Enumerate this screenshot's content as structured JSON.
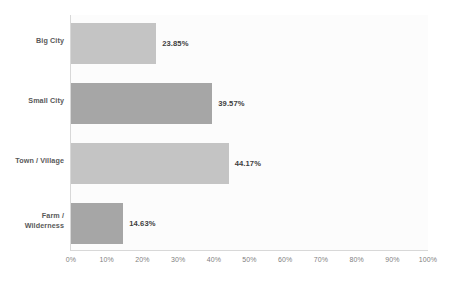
{
  "chart_data": {
    "type": "bar",
    "orientation": "horizontal",
    "title": "",
    "subtitle": "",
    "xlabel": "",
    "ylabel": "",
    "categories": [
      "Big City",
      "Small City",
      "Town / Village",
      "Farm / Wilderness"
    ],
    "values": [
      23.85,
      39.57,
      44.17,
      14.63
    ],
    "value_labels": [
      "23.85%",
      "39.57%",
      "44.17%",
      "14.63%"
    ],
    "xlim": [
      0,
      100
    ],
    "xticks": [
      0,
      10,
      20,
      30,
      40,
      50,
      60,
      70,
      80,
      90,
      100
    ],
    "xtick_labels": [
      "0%",
      "10%",
      "20%",
      "30%",
      "40%",
      "50%",
      "60%",
      "70%",
      "80%",
      "90%",
      "100%"
    ],
    "grid": false,
    "legend": false,
    "bar_colors": [
      "#c4c4c4",
      "#a6a6a6",
      "#c4c4c4",
      "#a6a6a6"
    ],
    "plot_background": "#fcfcfc",
    "page_background": "#ffffff",
    "axis_color": "#d8d8d8",
    "label_color": "#595959",
    "value_label_color": "#404040",
    "tick_label_color": "#7f7f7f"
  },
  "categories": {
    "c0_line1": "Big City",
    "c0_line2": "",
    "c1_line1": "Small City",
    "c1_line2": "",
    "c2_line1": "Town / Village",
    "c2_line2": "",
    "c3_line1": "Farm /",
    "c3_line2": "Wilderness"
  },
  "axis": {
    "t0": "0%",
    "t1": "10%",
    "t2": "20%",
    "t3": "30%",
    "t4": "40%",
    "t5": "50%",
    "t6": "60%",
    "t7": "70%",
    "t8": "80%",
    "t9": "90%",
    "t10": "100%"
  }
}
